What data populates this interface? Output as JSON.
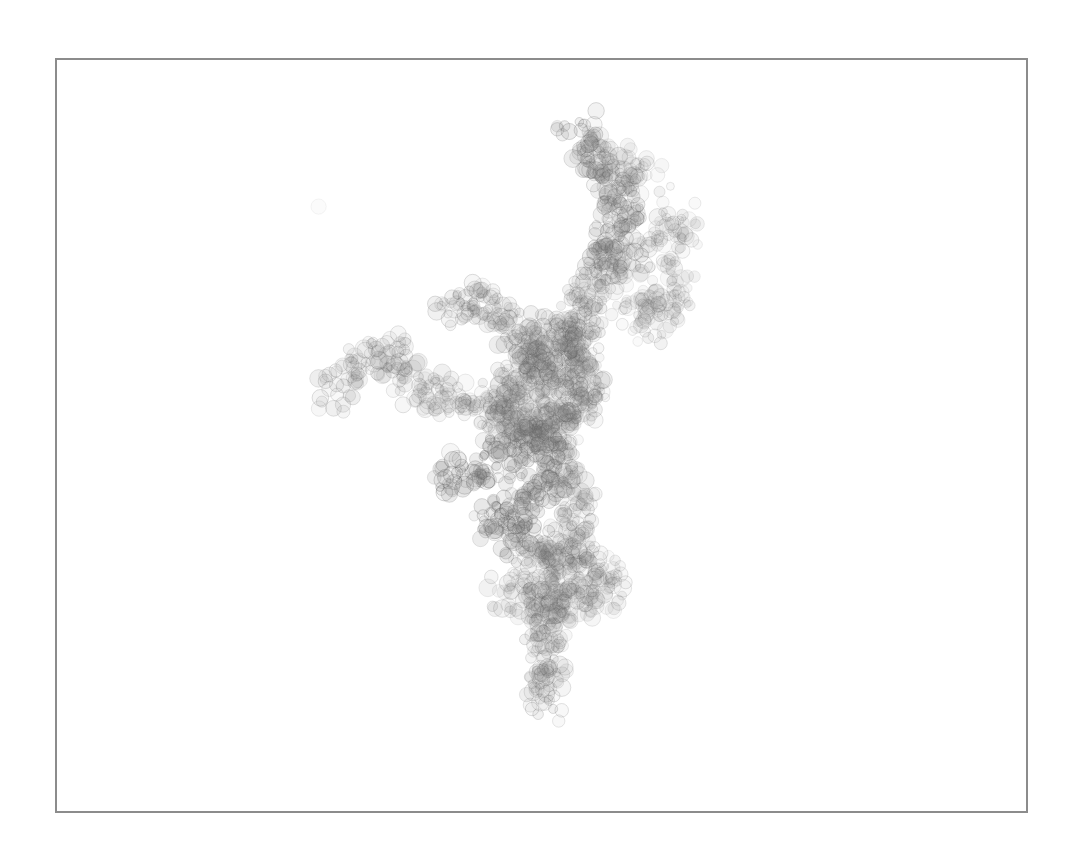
{
  "canvas": {
    "width": 1077,
    "height": 851,
    "background": "#ffffff",
    "frame": {
      "x": 55,
      "y": 58,
      "width": 971,
      "height": 753,
      "stroke": "#8c8c8c",
      "stroke_width": 2
    }
  },
  "artwork": {
    "description": "Branching coral/tree structure made of overlapping translucent gray circles",
    "circle_stroke": "#5a5a5a",
    "circle_fill": "#7a7a7a",
    "radius_range": [
      4,
      9
    ],
    "seed": 42,
    "branches": [
      {
        "name": "trunk-bottom",
        "density": 1.2,
        "alpha": 0.16,
        "points": [
          [
            545,
            705
          ],
          [
            548,
            670
          ],
          [
            545,
            640
          ],
          [
            548,
            610
          ],
          [
            555,
            580
          ],
          [
            565,
            550
          ],
          [
            575,
            520
          ],
          [
            570,
            490
          ],
          [
            560,
            460
          ],
          [
            555,
            430
          ],
          [
            560,
            400
          ],
          [
            565,
            370
          ],
          [
            575,
            340
          ],
          [
            585,
            300
          ],
          [
            600,
            270
          ]
        ]
      },
      {
        "name": "upper-stem",
        "density": 1.3,
        "alpha": 0.2,
        "points": [
          [
            600,
            270
          ],
          [
            615,
            245
          ],
          [
            625,
            220
          ],
          [
            620,
            195
          ],
          [
            605,
            170
          ],
          [
            590,
            150
          ],
          [
            578,
            132
          ]
        ]
      },
      {
        "name": "upper-twig",
        "density": 0.9,
        "alpha": 0.14,
        "points": [
          [
            605,
            170
          ],
          [
            625,
            160
          ],
          [
            640,
            165
          ],
          [
            650,
            180
          ]
        ]
      },
      {
        "name": "right-branch",
        "density": 1.0,
        "alpha": 0.14,
        "points": [
          [
            600,
            270
          ],
          [
            630,
            260
          ],
          [
            655,
            250
          ],
          [
            670,
            240
          ],
          [
            680,
            225
          ],
          [
            668,
            215
          ]
        ]
      },
      {
        "name": "right-lower",
        "density": 0.9,
        "alpha": 0.13,
        "points": [
          [
            610,
            300
          ],
          [
            640,
            305
          ],
          [
            665,
            300
          ],
          [
            678,
            290
          ],
          [
            660,
            320
          ],
          [
            640,
            330
          ]
        ]
      },
      {
        "name": "left-upper",
        "density": 1.0,
        "alpha": 0.17,
        "points": [
          [
            560,
            380
          ],
          [
            535,
            360
          ],
          [
            515,
            330
          ],
          [
            500,
            310
          ],
          [
            480,
            300
          ],
          [
            455,
            305
          ],
          [
            440,
            315
          ]
        ]
      },
      {
        "name": "left-far",
        "density": 1.0,
        "alpha": 0.16,
        "points": [
          [
            530,
            420
          ],
          [
            500,
            405
          ],
          [
            470,
            400
          ],
          [
            440,
            400
          ],
          [
            420,
            385
          ],
          [
            400,
            360
          ],
          [
            380,
            355
          ],
          [
            360,
            365
          ],
          [
            340,
            385
          ],
          [
            332,
            398
          ]
        ]
      },
      {
        "name": "left-mid",
        "density": 1.2,
        "alpha": 0.22,
        "points": [
          [
            555,
            440
          ],
          [
            530,
            445
          ],
          [
            505,
            455
          ],
          [
            485,
            465
          ],
          [
            465,
            470
          ],
          [
            445,
            478
          ]
        ]
      },
      {
        "name": "left-lower",
        "density": 1.2,
        "alpha": 0.22,
        "points": [
          [
            560,
            470
          ],
          [
            540,
            490
          ],
          [
            525,
            505
          ],
          [
            505,
            515
          ],
          [
            495,
            525
          ],
          [
            510,
            535
          ],
          [
            535,
            545
          ]
        ]
      },
      {
        "name": "core-fill",
        "density": 1.6,
        "alpha": 0.16,
        "points": [
          [
            500,
            420
          ],
          [
            530,
            430
          ],
          [
            560,
            420
          ],
          [
            580,
            400
          ],
          [
            590,
            380
          ],
          [
            580,
            350
          ],
          [
            560,
            330
          ],
          [
            545,
            340
          ],
          [
            520,
            380
          ],
          [
            510,
            410
          ]
        ]
      },
      {
        "name": "lower-bulge",
        "density": 1.3,
        "alpha": 0.14,
        "points": [
          [
            520,
            560
          ],
          [
            545,
            565
          ],
          [
            575,
            560
          ],
          [
            600,
            570
          ],
          [
            610,
            585
          ],
          [
            590,
            600
          ],
          [
            560,
            605
          ],
          [
            530,
            600
          ],
          [
            505,
            595
          ]
        ]
      },
      {
        "name": "stray",
        "density": 0.1,
        "alpha": 0.05,
        "points": [
          [
            330,
            195
          ],
          [
            331,
            196
          ]
        ]
      }
    ]
  }
}
